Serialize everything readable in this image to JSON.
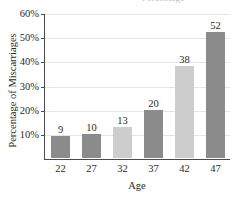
{
  "figure": {
    "title_sliver_text": "Percentage",
    "background_color": "#ffffff"
  },
  "chart_data": {
    "type": "bar",
    "title": "",
    "xlabel": "Age",
    "ylabel": "Percentage of Miscarriages",
    "categories": [
      "22",
      "27",
      "32",
      "37",
      "42",
      "47"
    ],
    "values": [
      9,
      10,
      13,
      20,
      38,
      52
    ],
    "value_labels": [
      "9",
      "10",
      "13",
      "20",
      "38",
      "52"
    ],
    "bar_colors": [
      "#8b8b8b",
      "#8b8b8b",
      "#cdcdcd",
      "#8b8b8b",
      "#cdcdcd",
      "#8b8b8b"
    ],
    "ylim": [
      0,
      60
    ],
    "xlim_note": "categorical",
    "yticks": [
      10,
      20,
      30,
      40,
      50,
      60
    ],
    "ytick_labels": [
      "10%",
      "20%",
      "30%",
      "40%",
      "50%",
      "60%"
    ],
    "grid": "horizontal",
    "grid_color": "#e4e4e4",
    "axis_color": "#4a4a4a",
    "legend": "none",
    "legend_position": "none",
    "value_labels_position": "above-bar"
  }
}
